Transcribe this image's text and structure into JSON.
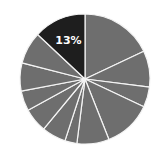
{
  "chart_data": {
    "type": "pie",
    "title": "",
    "categories": [
      "S1",
      "S2",
      "S3",
      "S4",
      "S5",
      "S6",
      "S7",
      "S8",
      "S9",
      "S10",
      "S11",
      "S12"
    ],
    "values": [
      18,
      9,
      5,
      12,
      8,
      3,
      6,
      6,
      5,
      7,
      8,
      13
    ],
    "labels": [
      "",
      "",
      "",
      "",
      "",
      "",
      "",
      "",
      "",
      "",
      "",
      "13%"
    ],
    "highlight_index": 11,
    "start_angle_deg": 0,
    "direction": "clockwise",
    "legend": "none",
    "colors": {
      "default": "#6e6e6e",
      "highlight": "#1e1e1e",
      "separator": "#f4f4f4",
      "label": "#ffffff"
    },
    "geometry": {
      "cx": 85,
      "cy": 79,
      "r": 65
    }
  }
}
